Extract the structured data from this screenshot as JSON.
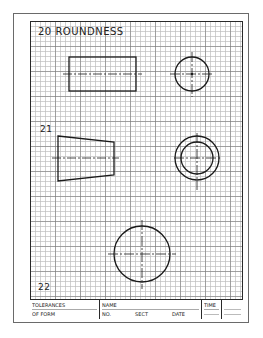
{
  "sheet": {
    "colors": {
      "line": "#1a1a1a",
      "grid_minor": "#bebebe",
      "grid_major": "#787878",
      "paper": "#ffffff"
    },
    "grid": {
      "minor_spacing_px": 5,
      "major_every": 5
    }
  },
  "problems": [
    {
      "number": "20",
      "title": "20 ROUNDNESS",
      "views": [
        {
          "type": "rectangle",
          "name": "cylinder-front-view",
          "x": 69,
          "y": 57,
          "width": 67,
          "height": 34,
          "centerline": {
            "x1": 63,
            "x2": 142,
            "y": 74
          }
        },
        {
          "type": "circle",
          "name": "cylinder-end-view",
          "cx": 192,
          "cy": 74,
          "r": 17,
          "crosshair": {
            "x1": 170,
            "x2": 214,
            "y1": 52,
            "y2": 97
          },
          "center_dot": true
        }
      ]
    },
    {
      "number": "21",
      "title": "21",
      "views": [
        {
          "type": "trapezoid",
          "name": "cone-front-view",
          "points": [
            [
              58,
              136
            ],
            [
              114,
              142
            ],
            [
              114,
              175
            ],
            [
              58,
              181
            ]
          ],
          "centerline": {
            "x1": 52,
            "x2": 119,
            "y": 158
          }
        },
        {
          "type": "concentric-circles",
          "name": "cone-end-view",
          "cx": 197,
          "cy": 158,
          "r_outer": 22,
          "r_inner": 16,
          "crosshair": {
            "x1": 174,
            "x2": 222,
            "y1": 133,
            "y2": 190
          }
        }
      ]
    },
    {
      "number": "22",
      "title": "22",
      "views": [
        {
          "type": "circle",
          "name": "sphere-view",
          "cx": 142,
          "cy": 254,
          "r": 28,
          "crosshair": {
            "x1": 108,
            "x2": 176,
            "y1": 220,
            "y2": 289
          },
          "center_dot": false
        }
      ]
    }
  ],
  "title_block": {
    "topic_line1": "TOLERANCES",
    "topic_line2": "OF FORM",
    "name_label": "NAME",
    "no_label": "NO.",
    "sect_label": "SECT",
    "date_label": "DATE",
    "time_label": "TIME"
  }
}
